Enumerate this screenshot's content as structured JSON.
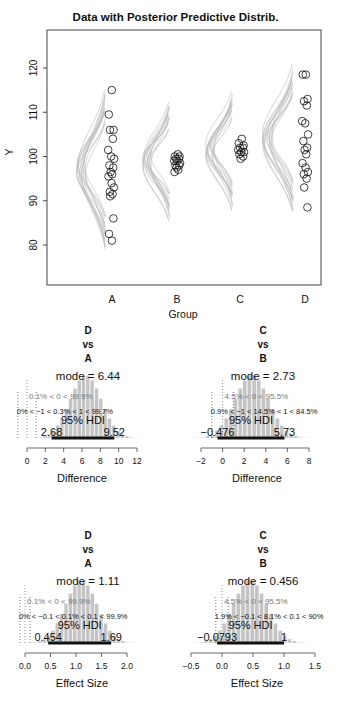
{
  "main_plot": {
    "title": "Data with Posterior Predictive Distrib.",
    "ylabel": "Y",
    "xlabel": "Group",
    "yticks": [
      "80",
      "90",
      "100",
      "110",
      "120"
    ],
    "groups": [
      "A",
      "B",
      "C",
      "D"
    ]
  },
  "panels": [
    {
      "title": [
        "D",
        "vs",
        "A"
      ],
      "mode": "mode = 6.44",
      "line1": "0.1% < 0 < 99.9%",
      "line2": "0% < −1 < 0.3% < 1 < 99.7%",
      "hdi_label": "95% HDI",
      "hdi_low": "2.68",
      "hdi_high": "9.52",
      "xticks": [
        "0",
        "2",
        "4",
        "6",
        "8",
        "10",
        "12"
      ],
      "xlabel": "Difference"
    },
    {
      "title": [
        "C",
        "vs",
        "B"
      ],
      "mode": "mode = 2.73",
      "line1": "4.5% < 0 < 95.5%",
      "line2": "0.9% < −1 < 14.5% < 1 < 84.5%",
      "hdi_label": "95% HDI",
      "hdi_low": "−0.476",
      "hdi_high": "5.73",
      "xticks": [
        "−2",
        "0",
        "2",
        "4",
        "6",
        "8"
      ],
      "xlabel": "Difference"
    },
    {
      "title": [
        "D",
        "vs",
        "A"
      ],
      "mode": "mode = 1.11",
      "line1": "0.1% < 0 < 99.9%",
      "line2": "0% < −0.1 < 0.1% < 0.1 < 99.9%",
      "hdi_label": "95% HDI",
      "hdi_low": "0.454",
      "hdi_high": "1.69",
      "xticks": [
        "0.0",
        "0.5",
        "1.0",
        "1.5",
        "2.0"
      ],
      "xlabel": "Effect Size"
    },
    {
      "title": [
        "C",
        "vs",
        "B"
      ],
      "mode": "mode = 0.456",
      "line1": "4.5% < 0 < 95.5%",
      "line2": "1.9% < −0.1 < 8.1% < 0.1 < 90%",
      "hdi_label": "95% HDI",
      "hdi_low": "−0.0793",
      "hdi_high": "1",
      "xticks": [
        "−0.5",
        "0.0",
        "0.5",
        "1.0",
        "1.5"
      ],
      "xlabel": "Effect Size"
    }
  ],
  "chart_data": [
    {
      "type": "scatter",
      "title": "Data with Posterior Predictive Distrib.",
      "xlabel": "Group",
      "ylabel": "Y",
      "categories": [
        "A",
        "B",
        "C",
        "D"
      ],
      "ylim": [
        70,
        128
      ],
      "series": [
        {
          "name": "A",
          "values": [
            115,
            109.5,
            106,
            106,
            104,
            101.5,
            100,
            99.5,
            98,
            97.5,
            96.5,
            96,
            95.5,
            94,
            93,
            92,
            91.5,
            91,
            86,
            82.5,
            81
          ]
        },
        {
          "name": "B",
          "values": [
            100.5,
            100,
            100,
            99.5,
            99.5,
            99,
            99,
            98.5,
            98,
            98,
            97.5,
            97,
            96.5
          ]
        },
        {
          "name": "C",
          "values": [
            104,
            103,
            102.5,
            102,
            102,
            101.5,
            101,
            101,
            100.5,
            100,
            99.5
          ]
        },
        {
          "name": "D",
          "values": [
            118.5,
            118.5,
            113,
            112.5,
            111.5,
            108,
            107.5,
            105,
            103.5,
            102,
            101.5,
            100.5,
            98.5,
            97.5,
            96.5,
            96,
            95,
            93,
            88.5
          ]
        }
      ]
    },
    {
      "type": "bar",
      "title": "D vs A",
      "xlabel": "Difference",
      "mode": 6.44,
      "hdi": [
        2.68,
        9.52
      ],
      "xlim": [
        0,
        12
      ]
    },
    {
      "type": "bar",
      "title": "C vs B",
      "xlabel": "Difference",
      "mode": 2.73,
      "hdi": [
        -0.476,
        5.73
      ],
      "xlim": [
        -2,
        8
      ]
    },
    {
      "type": "bar",
      "title": "D vs A",
      "xlabel": "Effect Size",
      "mode": 1.11,
      "hdi": [
        0.454,
        1.69
      ],
      "xlim": [
        0,
        2
      ]
    },
    {
      "type": "bar",
      "title": "C vs B",
      "xlabel": "Effect Size",
      "mode": 0.456,
      "hdi": [
        -0.0793,
        1
      ],
      "xlim": [
        -0.5,
        1.5
      ]
    }
  ]
}
